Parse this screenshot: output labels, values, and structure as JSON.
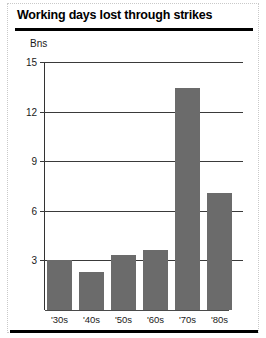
{
  "page": {
    "title": "Working days lost through strikes"
  },
  "chart_data": {
    "type": "bar",
    "title": "Working days lost through strikes",
    "xlabel": "",
    "ylabel": "Bns",
    "unit_label": "Bns",
    "categories": [
      "'30s",
      "'40s",
      "'50s",
      "'60s",
      "'70s",
      "'80s"
    ],
    "values": [
      3.0,
      2.3,
      3.3,
      3.6,
      13.4,
      7.1
    ],
    "ylim": [
      0,
      15
    ],
    "yticks": [
      15,
      12,
      9,
      6,
      3
    ],
    "ytick_labels": [
      "15",
      "12",
      "9",
      "6",
      "3"
    ],
    "grid": true,
    "legend": null,
    "bar_color": "#6b6b6b",
    "axis_color": "#333333",
    "rule_color": "#000000"
  }
}
